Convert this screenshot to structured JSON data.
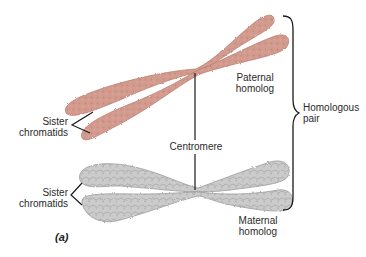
{
  "figure": {
    "panel_label": "(a)",
    "colors": {
      "paternal_fill": "#d39a8e",
      "paternal_stroke": "#b97d71",
      "maternal_fill": "#c9c9c9",
      "maternal_stroke": "#9a9a9a",
      "line": "#1a1a1a",
      "text": "#2b2b2b",
      "background": "#ffffff"
    },
    "labels": {
      "sister_chromatids_top": [
        "Sister",
        "chromatids"
      ],
      "sister_chromatids_bottom": [
        "Sister",
        "chromatids"
      ],
      "paternal_homolog": [
        "Paternal",
        "homolog"
      ],
      "maternal_homolog": [
        "Maternal",
        "homolog"
      ],
      "centromere": "Centromere",
      "homologous_pair": [
        "Homologous",
        "pair"
      ]
    },
    "chromosomes": [
      {
        "name": "paternal homolog",
        "color": "pink"
      },
      {
        "name": "maternal homolog",
        "color": "gray"
      }
    ]
  }
}
